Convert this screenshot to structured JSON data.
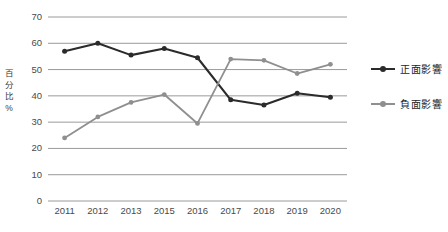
{
  "chart_data": {
    "type": "line",
    "title": "",
    "xlabel": "",
    "ylabel": "百分比%",
    "categories": [
      "2011",
      "2012",
      "2013",
      "2015",
      "2016",
      "2017",
      "2018",
      "2019",
      "2020"
    ],
    "ylim": [
      0,
      70
    ],
    "yticks": [
      "0",
      "10",
      "20",
      "30",
      "40",
      "50",
      "60",
      "70"
    ],
    "grid": true,
    "legend_position": "right",
    "series": [
      {
        "name": "正面影響",
        "color": "#2b2b2b",
        "values": [
          57,
          60,
          55.5,
          58,
          54.5,
          38.5,
          36.5,
          41,
          39.5
        ]
      },
      {
        "name": "負面影響",
        "color": "#8f8f8f",
        "values": [
          24,
          32,
          37.5,
          40.5,
          29.5,
          54,
          53.5,
          48.5,
          52
        ]
      }
    ]
  },
  "axis": {
    "y_title_chars": [
      "百",
      "分",
      "比",
      "%"
    ]
  },
  "colors": {
    "gridline": "#9a9a9a",
    "tick_text": "#4a4a4a",
    "legend_text": "#1d1d1d",
    "background": "#ffffff"
  }
}
